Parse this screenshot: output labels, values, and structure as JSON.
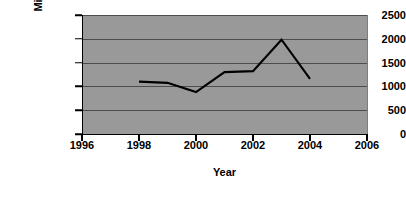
{
  "chart_data": {
    "type": "line",
    "title": "",
    "xlabel": "Year",
    "ylabel": "Million US$",
    "xlim": [
      1996,
      2006
    ],
    "ylim": [
      0,
      2500
    ],
    "xticks": [
      1996,
      1998,
      2000,
      2002,
      2004,
      2006
    ],
    "xtick_labels": [
      "1996",
      "1998",
      "2000",
      "2002",
      "2004",
      "2006"
    ],
    "yticks": [
      0,
      500,
      1000,
      1500,
      2000,
      2500
    ],
    "ytick_labels": [
      "0",
      "500",
      "1000",
      "1500",
      "2000",
      "2500"
    ],
    "grid": "horizontal",
    "legend": "none",
    "plot_background_color": "#999999",
    "line_color": "#000000",
    "series": [
      {
        "name": "Million US$",
        "x": [
          1998,
          1999,
          2000,
          2001,
          2002,
          2003,
          2004
        ],
        "values": [
          1100,
          1075,
          880,
          1300,
          1320,
          1980,
          1160
        ]
      }
    ]
  }
}
